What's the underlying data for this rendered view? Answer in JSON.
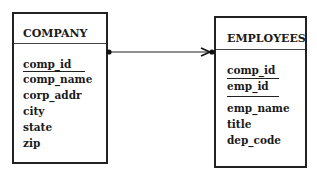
{
  "entities": {
    "company": {
      "title": "COMPANY",
      "primary_keys": [
        "comp_id"
      ],
      "attributes": [
        "comp_name",
        "corp_addr",
        "city",
        "state",
        "zip"
      ]
    },
    "employees": {
      "title": "EMPLOYEES",
      "primary_keys": [
        "comp_id",
        "emp_id"
      ],
      "attributes": [
        "emp_name",
        "title",
        "dep_code"
      ]
    }
  },
  "relationship": {
    "from": "COMPANY",
    "to": "EMPLOYEES",
    "cardinality": "one-to-many",
    "color": "#222222"
  }
}
